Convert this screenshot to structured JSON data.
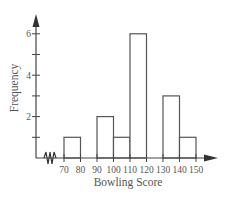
{
  "chart_data": {
    "type": "bar",
    "subtype": "histogram",
    "title": "",
    "xlabel": "Bowling Score",
    "ylabel": "Frequency",
    "bin_edges": [
      70,
      80,
      90,
      100,
      110,
      120,
      130,
      140,
      150
    ],
    "categories": [
      "70-80",
      "80-90",
      "90-100",
      "100-110",
      "110-120",
      "120-130",
      "130-140",
      "140-150"
    ],
    "values": [
      1,
      0,
      2,
      1,
      6,
      0,
      3,
      1
    ],
    "x_tick_labels": [
      "70",
      "80",
      "90",
      "100",
      "110",
      "120",
      "130",
      "140",
      "150"
    ],
    "y_tick_labels": [
      "2",
      "4",
      "6"
    ],
    "y_ticks_minor": [
      1,
      3,
      5
    ],
    "ylim": [
      0,
      6.5
    ],
    "xlim": [
      60,
      160
    ],
    "x_axis_break": true,
    "grid": false,
    "legend": null,
    "colors": {
      "bar_fill": "#ffffff",
      "bar_stroke": "#555555",
      "axis": "#444444"
    }
  }
}
